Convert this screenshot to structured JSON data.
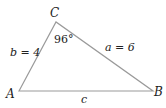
{
  "diagram": {
    "type": "triangle",
    "vertices": {
      "A": {
        "label": "A"
      },
      "B": {
        "label": "B"
      },
      "C": {
        "label": "C"
      }
    },
    "sides": {
      "a": {
        "label": "a = 6"
      },
      "b": {
        "label": "b = 4"
      },
      "c": {
        "label": "c"
      }
    },
    "angles": {
      "C": {
        "label": "96°"
      }
    },
    "colors": {
      "line": "#9a9a9a",
      "text": "#222222"
    }
  }
}
